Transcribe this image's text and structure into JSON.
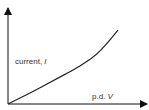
{
  "chart_data": {
    "type": "line",
    "title": "",
    "xlabel": "p.d. V",
    "ylabel": "current, I",
    "xlabel_parts": {
      "text": "p.d. ",
      "symbol": "V"
    },
    "ylabel_parts": {
      "text": "current, ",
      "symbol": "I"
    },
    "grid": false,
    "legend": null,
    "ticks": {
      "x": [],
      "y": []
    },
    "series": [
      {
        "name": "I-V characteristic",
        "description": "Linear from origin, then curving upward more steeply",
        "x": [
          0,
          0.2,
          0.4,
          0.6,
          0.7,
          0.8,
          0.9,
          1.0
        ],
        "y": [
          0,
          0.13,
          0.27,
          0.41,
          0.49,
          0.58,
          0.72,
          0.88
        ]
      }
    ],
    "colors": {
      "axis": "#111111",
      "curve": "#222222",
      "text": "#333333"
    }
  }
}
